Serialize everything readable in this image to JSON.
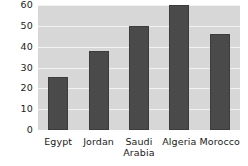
{
  "chart_data": {
    "type": "bar",
    "title": "",
    "subtitle": "",
    "xlabel": "",
    "ylabel": "",
    "categories": [
      "Egypt",
      "Jordan",
      "Saudi\nArabia",
      "Algeria",
      "Morocco"
    ],
    "values": [
      25.5,
      38,
      50,
      60,
      46
    ],
    "ylim": [
      0,
      60
    ],
    "yticks": [
      0,
      10,
      20,
      30,
      40,
      50,
      60
    ],
    "ytick_labels": [
      "0",
      "10",
      "20",
      "30",
      "40",
      "50",
      "60"
    ],
    "grid": true,
    "grid_axis": "y",
    "legend": false,
    "legend_position": "none",
    "annotations": [],
    "colors": {
      "bar_fill": "#4a4a4a",
      "bar_stroke": "#3c3c3c",
      "plot_background": "#d7d7d7",
      "gridline": "#f2f2f2",
      "figure_background": "#ffffff",
      "tick_text": "#1a1a1a"
    }
  }
}
